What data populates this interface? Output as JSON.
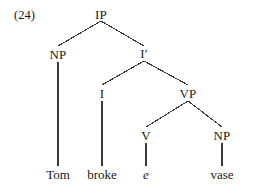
{
  "figure": {
    "example_number": "(24)",
    "background_color": "#ffffff",
    "line_color": "#3a3a3a",
    "text_color": "#1a1a1a"
  },
  "tree": {
    "type": "syntax-tree",
    "sentence": "Tom broke e vase",
    "nodes": [
      {
        "id": "IP",
        "label": "IP",
        "x": 101,
        "y": 14,
        "italic": false
      },
      {
        "id": "NP1",
        "label": "NP",
        "x": 58,
        "y": 54,
        "italic": false
      },
      {
        "id": "Ibar",
        "label": "I′",
        "x": 144,
        "y": 53,
        "italic": false
      },
      {
        "id": "I",
        "label": "I",
        "x": 102,
        "y": 93,
        "italic": false
      },
      {
        "id": "VP",
        "label": "VP",
        "x": 188,
        "y": 93,
        "italic": false
      },
      {
        "id": "V",
        "label": "V",
        "x": 146,
        "y": 135,
        "italic": false
      },
      {
        "id": "NP2",
        "label": "NP",
        "x": 222,
        "y": 135,
        "italic": false
      }
    ],
    "terminals": [
      {
        "id": "t-tom",
        "label": "Tom",
        "x": 58,
        "y": 174,
        "italic": false,
        "parent": "NP1"
      },
      {
        "id": "t-broke",
        "label": "broke",
        "x": 102,
        "y": 174,
        "italic": false,
        "parent": "I"
      },
      {
        "id": "t-e",
        "label": "e",
        "x": 146,
        "y": 174,
        "italic": true,
        "parent": "V"
      },
      {
        "id": "t-vase",
        "label": "vase",
        "x": 222,
        "y": 174,
        "italic": false,
        "parent": "NP2"
      }
    ],
    "edges": [
      {
        "from": "IP",
        "to": "NP1",
        "x1": 101,
        "y1": 21,
        "x2": 58,
        "y2": 46
      },
      {
        "from": "IP",
        "to": "Ibar",
        "x1": 101,
        "y1": 21,
        "x2": 144,
        "y2": 46
      },
      {
        "from": "Ibar",
        "to": "I",
        "x1": 144,
        "y1": 61,
        "x2": 102,
        "y2": 85
      },
      {
        "from": "Ibar",
        "to": "VP",
        "x1": 144,
        "y1": 61,
        "x2": 188,
        "y2": 85
      },
      {
        "from": "VP",
        "to": "V",
        "x1": 188,
        "y1": 101,
        "x2": 146,
        "y2": 127
      },
      {
        "from": "VP",
        "to": "NP2",
        "x1": 188,
        "y1": 101,
        "x2": 222,
        "y2": 127
      },
      {
        "from": "NP1",
        "to": "t-tom",
        "x1": 58,
        "y1": 62,
        "x2": 58,
        "y2": 166
      },
      {
        "from": "I",
        "to": "t-broke",
        "x1": 102,
        "y1": 101,
        "x2": 102,
        "y2": 166
      },
      {
        "from": "V",
        "to": "t-e",
        "x1": 146,
        "y1": 143,
        "x2": 146,
        "y2": 166
      },
      {
        "from": "NP2",
        "to": "t-vase",
        "x1": 222,
        "y1": 143,
        "x2": 222,
        "y2": 166
      }
    ]
  }
}
